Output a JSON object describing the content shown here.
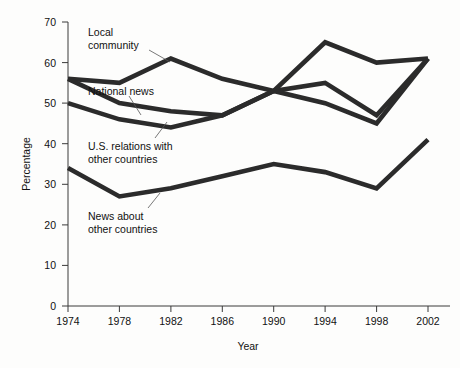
{
  "chart_data": {
    "type": "line",
    "title": "",
    "xlabel": "Year",
    "ylabel": "Percentage",
    "categories": [
      1974,
      1978,
      1982,
      1986,
      1990,
      1994,
      1998,
      2002
    ],
    "x": [
      "1974",
      "1978",
      "1982",
      "1986",
      "1990",
      "1994",
      "1998",
      "2002"
    ],
    "xlim": [
      1974,
      2002
    ],
    "ylim": [
      0,
      70
    ],
    "y_ticks": [
      "0",
      "10",
      "20",
      "30",
      "40",
      "50",
      "60",
      "70"
    ],
    "grid": false,
    "legend": "inline-annotations",
    "series": [
      {
        "name": "Local community",
        "values": [
          56,
          55,
          61,
          56,
          53,
          65,
          60,
          61
        ]
      },
      {
        "name": "National news",
        "values": [
          56,
          50,
          48,
          47,
          53,
          55,
          47,
          61
        ]
      },
      {
        "name": "U.S. relations with other countries",
        "values": [
          50,
          46,
          44,
          47,
          53,
          50,
          45,
          61
        ]
      },
      {
        "name": "News about other countries",
        "values": [
          34,
          27,
          29,
          32,
          35,
          33,
          29,
          41
        ]
      }
    ],
    "annotations": [
      {
        "text_line1": "Local",
        "text_line2": "community",
        "target": "Local community"
      },
      {
        "text_line1": "National news",
        "text_line2": "",
        "target": "National news"
      },
      {
        "text_line1": "U.S. relations with",
        "text_line2": "other countries",
        "target": "U.S. relations with other countries"
      },
      {
        "text_line1": "News about",
        "text_line2": "other countries",
        "target": "News about other countries"
      }
    ],
    "line_color": "#2b2b2b",
    "axis_color": "#3a3a3a",
    "background_color": "#fdfdfc"
  },
  "axes": {
    "y_title": "Percentage",
    "x_title": "Year",
    "y_ticks": [
      "70",
      "60",
      "50",
      "40",
      "30",
      "20",
      "10",
      "0"
    ],
    "x_ticks": [
      "1974",
      "1978",
      "1982",
      "1986",
      "1990",
      "1994",
      "1998",
      "2002"
    ]
  },
  "labels": {
    "local_community_l1": "Local",
    "local_community_l2": "community",
    "national_news": "National news",
    "us_relations_l1": "U.S. relations with",
    "us_relations_l2": "other countries",
    "news_other_l1": "News about",
    "news_other_l2": "other countries"
  }
}
